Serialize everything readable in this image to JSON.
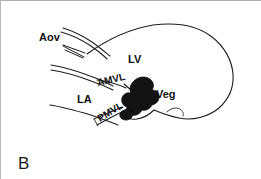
{
  "figure": {
    "panel_letter": "B",
    "caption_absent": true,
    "background_color": "#ffffff",
    "ink_color": "#1d1d1d",
    "frame_color": "#b9b9b9",
    "vegetation_fill": "#131313"
  },
  "labels": {
    "aortic_valve": "Aov",
    "left_ventricle": "LV",
    "left_atrium": "LA",
    "anterior_mitral_leaflet": "AMVL",
    "posterior_mitral_leaflet": "PMVL",
    "vegetation": "Veg"
  },
  "label_positions": {
    "aortic_valve": {
      "x": 38,
      "y": 40,
      "rotation": 0
    },
    "left_ventricle": {
      "x": 127,
      "y": 62,
      "rotation": 0
    },
    "left_atrium": {
      "x": 76,
      "y": 102,
      "rotation": 0
    },
    "anterior_mitral_leaflet": {
      "x": 97,
      "y": 85,
      "rotation": -13
    },
    "posterior_mitral_leaflet": {
      "x": 99,
      "y": 121,
      "rotation": -32
    },
    "vegetation": {
      "x": 155,
      "y": 97,
      "rotation": 0
    },
    "panel_letter": {
      "x": 17,
      "y": 168,
      "rotation": 0
    }
  },
  "structures": [
    {
      "name": "lv-outer-wall",
      "description": "Left ventricular chamber outline, long-axis, apex to the right"
    },
    {
      "name": "aortic-root-wall",
      "description": "Aortic root walls leading up and left from the LV outflow tract"
    },
    {
      "name": "aortic-valve-leaflets",
      "description": "Thin open aortic valve leaflet lines"
    },
    {
      "name": "la-posterior-wall",
      "description": "Left atrial posterior wall line"
    },
    {
      "name": "anterior-mitral-leaflet-line",
      "description": "Anterior mitral valve leaflet stroke"
    },
    {
      "name": "posterior-mitral-leaflet-line",
      "description": "Posterior mitral valve leaflet stroke"
    },
    {
      "name": "vegetation-mass",
      "description": "Solid black irregular vegetation attached to the mitral valve"
    }
  ]
}
